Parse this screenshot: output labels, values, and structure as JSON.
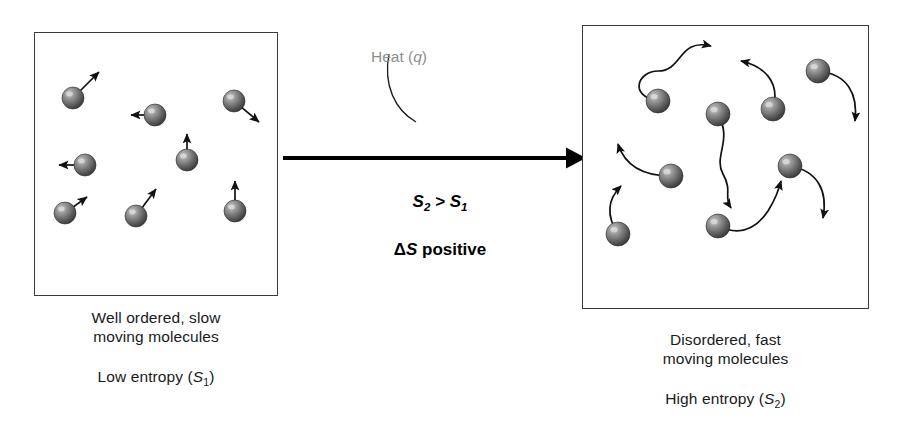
{
  "diagram": {
    "arrow": {
      "name": "heat-transfer-arrow",
      "direction": "left-to-right"
    },
    "heat_label": {
      "text_prefix": "Heat (",
      "symbol": "q",
      "text_suffix": ")",
      "color": "#8e8e8e"
    }
  },
  "left_panel": {
    "state_name": "low-entropy-state",
    "caption_line1": "Well ordered, slow",
    "caption_line2": "moving molecules",
    "entropy_prefix": "Low entropy (",
    "entropy_symbol": "S",
    "entropy_subscript": "1",
    "entropy_suffix": ")",
    "molecule_count": 8,
    "molecules": [
      {
        "cx": 38,
        "cy": 65,
        "r": 11,
        "vx": 26,
        "vy": -26
      },
      {
        "cx": 120,
        "cy": 82,
        "r": 11,
        "vx": -24,
        "vy": 0
      },
      {
        "cx": 199,
        "cy": 68,
        "r": 11,
        "vx": 25,
        "vy": 21
      },
      {
        "cx": 50,
        "cy": 132,
        "r": 11,
        "vx": -26,
        "vy": 0
      },
      {
        "cx": 152,
        "cy": 127,
        "r": 11,
        "vx": 0,
        "vy": -26
      },
      {
        "cx": 30,
        "cy": 180,
        "r": 11,
        "vx": 22,
        "vy": -16
      },
      {
        "cx": 101,
        "cy": 183,
        "r": 11,
        "vx": 20,
        "vy": -27
      },
      {
        "cx": 200,
        "cy": 178,
        "r": 11,
        "vx": 0,
        "vy": -30
      }
    ]
  },
  "right_panel": {
    "state_name": "high-entropy-state",
    "caption_line1": "Disordered, fast",
    "caption_line2": "moving molecules",
    "entropy_prefix": "High entropy (",
    "entropy_symbol": "S",
    "entropy_subscript": "2",
    "entropy_suffix": ")",
    "molecule_count": 8,
    "molecules": [
      {
        "cx": 75,
        "cy": 75,
        "r": 12,
        "path": "M 75 75 C 45 70 55 45 75 45 C 100 45 95 12 128 20"
      },
      {
        "cx": 135,
        "cy": 88,
        "r": 12,
        "path": "M 135 88 C 150 115 130 130 140 148 C 150 166 140 170 148 182"
      },
      {
        "cx": 190,
        "cy": 83,
        "r": 12,
        "path": "M 190 83 C 198 55 180 40 158 35"
      },
      {
        "cx": 235,
        "cy": 45,
        "r": 12,
        "path": "M 235 45 C 265 48 275 68 272 95"
      },
      {
        "cx": 88,
        "cy": 150,
        "r": 12,
        "path": "M 88 150 C 60 150 42 140 35 118"
      },
      {
        "cx": 207,
        "cy": 140,
        "r": 12,
        "path": "M 207 140 C 235 145 245 165 240 192"
      },
      {
        "cx": 35,
        "cy": 208,
        "r": 12,
        "path": "M 35 208 C 20 185 28 170 38 160"
      },
      {
        "cx": 135,
        "cy": 200,
        "r": 12,
        "path": "M 135 200 C 160 212 175 200 185 185 C 193 172 195 165 198 155"
      }
    ]
  },
  "center": {
    "comparison_lhs": "S",
    "comparison_lhs_sub": "2",
    "comparison_op": ">",
    "comparison_rhs": "S",
    "comparison_rhs_sub": "1",
    "delta_symbol": "Δ",
    "delta_var": "S",
    "delta_word": "positive"
  }
}
